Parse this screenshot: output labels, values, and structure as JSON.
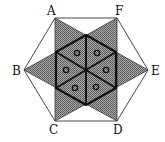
{
  "diagram": {
    "type": "geometry",
    "labels": {
      "A": "A",
      "B": "B",
      "C": "C",
      "D": "D",
      "E": "E",
      "F": "F"
    },
    "shaded_region": "hexagram",
    "inner_triangles_count": 6,
    "marker": "small-circle",
    "colors": {
      "stroke": "#111111",
      "shade": "#8a8a8a",
      "background": "#ffffff"
    }
  }
}
